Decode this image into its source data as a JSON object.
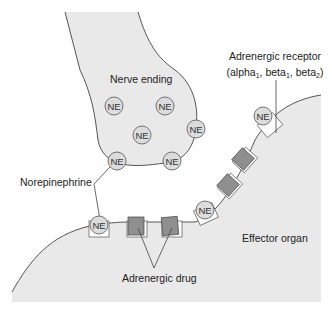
{
  "colors": {
    "tissue_fill": "#e9e9e9",
    "outline": "#444444",
    "ne_fill": "#dcdcdc",
    "drug_fill": "#8f8f8f",
    "receptor_fill": "#ffffff",
    "text": "#222222"
  },
  "labels": {
    "nerve_ending": "Nerve ending",
    "norepinephrine": "Norepinephrine",
    "receptor_line1": "Adrenergic receptor",
    "receptor_line2_open": "(alpha",
    "receptor_sub1": "1",
    "receptor_sep1": ", beta",
    "receptor_sub2": "1",
    "receptor_sep2": ", beta",
    "receptor_sub3": "2",
    "receptor_close": ")",
    "effector_organ": "Effector organ",
    "adrenergic_drug": "Adrenergic drug"
  },
  "molecules": {
    "ne_label": "NE",
    "ne_in_nerve_ending": 6,
    "ne_bound_to_receptors": 3,
    "drug_bound_to_receptors": 4
  }
}
